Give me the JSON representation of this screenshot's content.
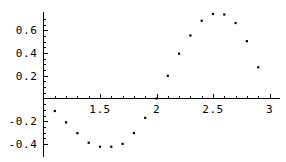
{
  "chart_data": {
    "type": "scatter",
    "title": "",
    "subtitle": "",
    "xlabel": "",
    "ylabel": "",
    "xlim": [
      1.0,
      3.0
    ],
    "ylim": [
      -0.46,
      0.78
    ],
    "grid": false,
    "legend": null,
    "legend_position": "none",
    "marker": "point",
    "marker_color": "#000000",
    "axis_color": "#000000",
    "background_color": "#ffffff",
    "x_ticks_major": [
      1.5,
      2,
      2.5,
      3
    ],
    "x_tick_labels": [
      "1.5",
      "2",
      "2.5",
      "3"
    ],
    "x_ticks_minor": [
      1.1,
      1.2,
      1.3,
      1.4,
      1.6,
      1.7,
      1.8,
      1.9,
      2.1,
      2.2,
      2.3,
      2.4,
      2.6,
      2.7,
      2.8,
      2.9
    ],
    "y_ticks_major": [
      -0.4,
      -0.2,
      0.2,
      0.4,
      0.6
    ],
    "y_tick_labels": [
      "-0.4",
      "-0.2",
      "0.2",
      "0.4",
      "0.6"
    ],
    "y_ticks_minor": [
      -0.35,
      -0.3,
      -0.25,
      -0.15,
      -0.1,
      -0.05,
      0.05,
      0.1,
      0.15,
      0.25,
      0.3,
      0.35,
      0.45,
      0.5,
      0.55,
      0.65,
      0.7
    ],
    "x": [
      1.1,
      1.2,
      1.3,
      1.4,
      1.5,
      1.6,
      1.7,
      1.8,
      1.9,
      2.0,
      2.1,
      2.2,
      2.3,
      2.4,
      2.5,
      2.6,
      2.7,
      2.8,
      2.9
    ],
    "y": [
      -0.11,
      -0.21,
      -0.305,
      -0.39,
      -0.425,
      -0.425,
      -0.4,
      -0.305,
      -0.17,
      0.0,
      0.2,
      0.395,
      0.555,
      0.685,
      0.745,
      0.74,
      0.665,
      0.505,
      0.275
    ],
    "points": [
      {
        "x": 1.1,
        "y": -0.11
      },
      {
        "x": 1.2,
        "y": -0.21
      },
      {
        "x": 1.3,
        "y": -0.305
      },
      {
        "x": 1.4,
        "y": -0.39
      },
      {
        "x": 1.5,
        "y": -0.425
      },
      {
        "x": 1.6,
        "y": -0.425
      },
      {
        "x": 1.7,
        "y": -0.4
      },
      {
        "x": 1.8,
        "y": -0.305
      },
      {
        "x": 1.9,
        "y": -0.17
      },
      {
        "x": 2.0,
        "y": 0.0
      },
      {
        "x": 2.1,
        "y": 0.2
      },
      {
        "x": 2.2,
        "y": 0.395
      },
      {
        "x": 2.3,
        "y": 0.555
      },
      {
        "x": 2.4,
        "y": 0.685
      },
      {
        "x": 2.5,
        "y": 0.745
      },
      {
        "x": 2.6,
        "y": 0.74
      },
      {
        "x": 2.7,
        "y": 0.665
      },
      {
        "x": 2.8,
        "y": 0.505
      },
      {
        "x": 2.9,
        "y": 0.275
      }
    ]
  },
  "plot": {
    "label": "scatter-plot"
  }
}
